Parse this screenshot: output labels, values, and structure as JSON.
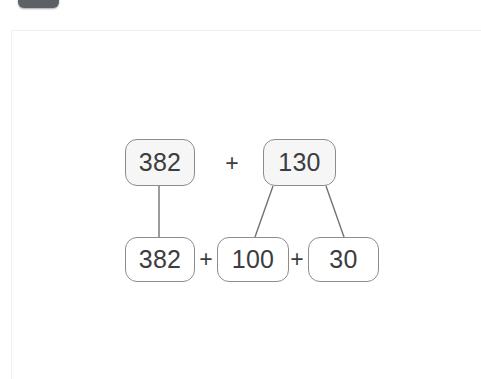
{
  "window": {
    "top_pill_label": "",
    "background_color": "#ffffff"
  },
  "card": {
    "background_color": "#ffffff",
    "border_color": "#f1f1f1"
  },
  "diagram": {
    "type": "number-bond-decomposition",
    "title": "",
    "expression_top": "382 + 130",
    "expression_bottom": "382 + 100 + 30",
    "colors": {
      "box_stroke": "#8a8d90",
      "top_box_fill": "#f6f6f6",
      "bottom_box_fill": "#ffffff",
      "text": "#3b3d40",
      "connector": "#6f7276"
    },
    "nodes": [
      {
        "id": "top-382",
        "value": "382",
        "row": "top",
        "x": 113,
        "y": 108,
        "w": 70,
        "h": 47
      },
      {
        "id": "top-130",
        "value": "130",
        "row": "top",
        "x": 251,
        "y": 108,
        "w": 73,
        "h": 47
      },
      {
        "id": "bottom-382",
        "value": "382",
        "row": "bottom",
        "x": 113,
        "y": 206,
        "w": 70,
        "h": 45
      },
      {
        "id": "bottom-100",
        "value": "100",
        "row": "bottom",
        "x": 205,
        "y": 206,
        "w": 72,
        "h": 45
      },
      {
        "id": "bottom-30",
        "value": "30",
        "row": "bottom",
        "x": 296,
        "y": 206,
        "w": 71,
        "h": 45
      }
    ],
    "operators": [
      {
        "id": "plus-top",
        "symbol": "+",
        "x": 208,
        "y": 120,
        "w": 24,
        "h": 24
      },
      {
        "id": "plus-bottom-1",
        "symbol": "+",
        "x": 183,
        "y": 217,
        "w": 22,
        "h": 22
      },
      {
        "id": "plus-bottom-2",
        "symbol": "+",
        "x": 274,
        "y": 217,
        "w": 22,
        "h": 22
      }
    ],
    "connectors": [
      {
        "id": "link-382",
        "from": "top-382",
        "to": "bottom-382",
        "x1": 147,
        "y1": 155,
        "x2": 147,
        "y2": 206
      },
      {
        "id": "link-130-100",
        "from": "top-130",
        "to": "bottom-100",
        "x1": 261,
        "y1": 155,
        "x2": 243,
        "y2": 206
      },
      {
        "id": "link-130-30",
        "from": "top-130",
        "to": "bottom-30",
        "x1": 314,
        "y1": 155,
        "x2": 332,
        "y2": 206
      }
    ]
  }
}
